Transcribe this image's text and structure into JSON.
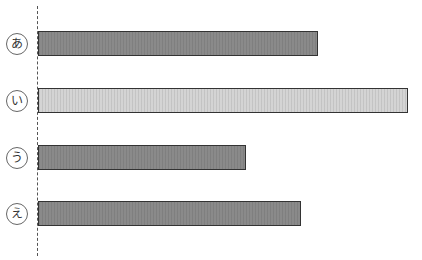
{
  "chart_data": {
    "type": "bar",
    "orientation": "horizontal",
    "title": "",
    "xlabel": "",
    "ylabel": "",
    "categories": [
      "あ",
      "い",
      "う",
      "え"
    ],
    "values": [
      280,
      370,
      208,
      263
    ],
    "units": "px (relative length, no axis scale shown)",
    "colors": [
      "#8a8a8a",
      "#d4d4d4",
      "#8a8a8a",
      "#8a8a8a"
    ],
    "grid": false,
    "baseline": "dashed vertical line at left",
    "legend": null
  }
}
